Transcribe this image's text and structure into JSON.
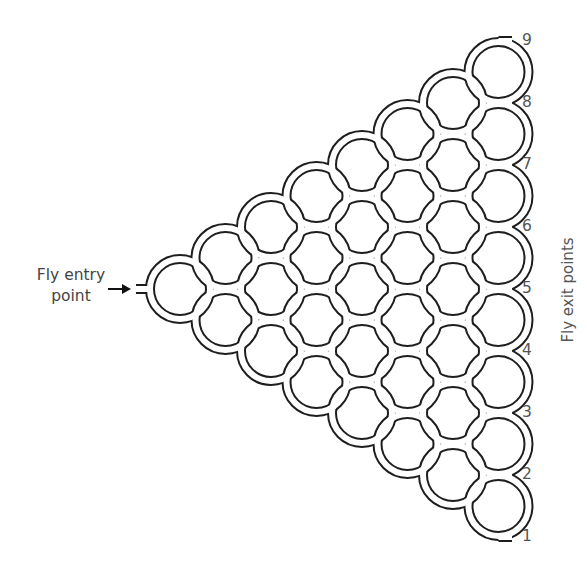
{
  "entry": {
    "label_line1": "Fly entry",
    "label_line2": "point",
    "icon": "arrow-right-icon"
  },
  "exits": {
    "title": "Fly exit points",
    "labels": [
      "1",
      "2",
      "3",
      "4",
      "5",
      "6",
      "7",
      "8",
      "9"
    ]
  },
  "geometry": {
    "columns": 8,
    "entry_y": 289,
    "first_col_x": 180,
    "col_dx": 45.5,
    "row_dy": 31,
    "cell_r": 30,
    "tube_gap": 6,
    "stroke": "#1e1e1e",
    "exit_end_x": 512,
    "label_x": 522
  }
}
